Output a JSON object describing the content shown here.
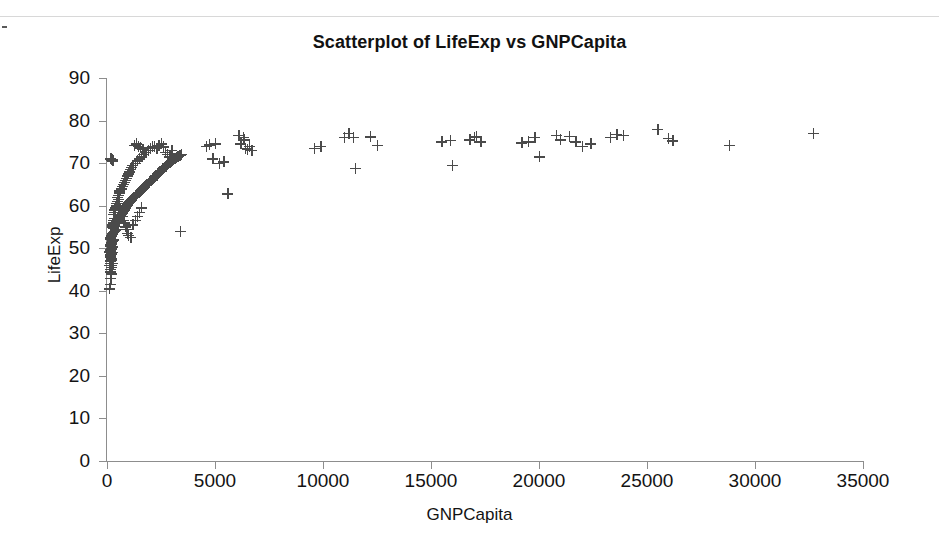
{
  "chart_data": {
    "type": "scatter",
    "title": "Scatterplot of LifeExp vs GNPCapita",
    "xlabel": "GNPCapita",
    "ylabel": "LifeExp",
    "xlim": [
      0,
      35000
    ],
    "ylim": [
      0,
      90
    ],
    "xticks": [
      0,
      5000,
      10000,
      15000,
      20000,
      25000,
      30000,
      35000
    ],
    "yticks": [
      0,
      10,
      20,
      30,
      40,
      50,
      60,
      70,
      80,
      90
    ],
    "grid": false,
    "legend": null,
    "marker": "plus",
    "marker_color": "#4a4a4a",
    "points": [
      [
        120,
        40.5
      ],
      [
        150,
        41.5
      ],
      [
        170,
        43.0
      ],
      [
        190,
        44.0
      ],
      [
        200,
        45.5
      ],
      [
        130,
        46.0
      ],
      [
        160,
        46.5
      ],
      [
        180,
        47.0
      ],
      [
        210,
        47.2
      ],
      [
        230,
        47.5
      ],
      [
        140,
        48.0
      ],
      [
        165,
        48.2
      ],
      [
        185,
        48.5
      ],
      [
        205,
        48.7
      ],
      [
        225,
        48.9
      ],
      [
        250,
        49.0
      ],
      [
        135,
        49.2
      ],
      [
        155,
        49.4
      ],
      [
        175,
        49.6
      ],
      [
        195,
        49.8
      ],
      [
        215,
        50.0
      ],
      [
        240,
        50.2
      ],
      [
        260,
        50.4
      ],
      [
        145,
        50.6
      ],
      [
        168,
        50.8
      ],
      [
        188,
        51.0
      ],
      [
        208,
        51.2
      ],
      [
        228,
        51.4
      ],
      [
        255,
        51.6
      ],
      [
        275,
        51.8
      ],
      [
        300,
        52.0
      ],
      [
        158,
        52.2
      ],
      [
        178,
        52.5
      ],
      [
        198,
        52.8
      ],
      [
        218,
        53.0
      ],
      [
        245,
        53.2
      ],
      [
        270,
        53.5
      ],
      [
        320,
        53.8
      ],
      [
        350,
        54.0
      ],
      [
        380,
        54.2
      ],
      [
        410,
        54.5
      ],
      [
        280,
        54.8
      ],
      [
        310,
        55.0
      ],
      [
        340,
        55.2
      ],
      [
        370,
        55.5
      ],
      [
        400,
        55.8
      ],
      [
        430,
        56.0
      ],
      [
        460,
        56.2
      ],
      [
        490,
        56.5
      ],
      [
        520,
        56.8
      ],
      [
        550,
        57.0
      ],
      [
        580,
        57.2
      ],
      [
        610,
        57.5
      ],
      [
        640,
        57.8
      ],
      [
        670,
        58.0
      ],
      [
        700,
        58.2
      ],
      [
        730,
        58.5
      ],
      [
        760,
        58.8
      ],
      [
        790,
        59.0
      ],
      [
        820,
        59.2
      ],
      [
        850,
        59.5
      ],
      [
        880,
        59.8
      ],
      [
        910,
        60.0
      ],
      [
        940,
        60.2
      ],
      [
        970,
        60.5
      ],
      [
        1000,
        60.8
      ],
      [
        1050,
        61.0
      ],
      [
        1100,
        61.2
      ],
      [
        1150,
        61.5
      ],
      [
        1200,
        61.8
      ],
      [
        1250,
        62.0
      ],
      [
        1300,
        62.2
      ],
      [
        1350,
        62.5
      ],
      [
        1400,
        62.8
      ],
      [
        1450,
        63.0
      ],
      [
        1500,
        63.2
      ],
      [
        1550,
        63.5
      ],
      [
        1600,
        63.8
      ],
      [
        1650,
        64.0
      ],
      [
        1700,
        64.2
      ],
      [
        1750,
        64.5
      ],
      [
        1800,
        64.8
      ],
      [
        1850,
        65.0
      ],
      [
        1900,
        65.2
      ],
      [
        1950,
        65.5
      ],
      [
        2000,
        65.8
      ],
      [
        2050,
        66.0
      ],
      [
        2100,
        66.2
      ],
      [
        2150,
        66.5
      ],
      [
        2200,
        66.8
      ],
      [
        2250,
        67.0
      ],
      [
        2300,
        67.2
      ],
      [
        2350,
        67.5
      ],
      [
        2400,
        67.8
      ],
      [
        2450,
        68.0
      ],
      [
        2500,
        68.2
      ],
      [
        2550,
        68.5
      ],
      [
        2600,
        68.8
      ],
      [
        2650,
        69.0
      ],
      [
        2700,
        69.2
      ],
      [
        2750,
        69.5
      ],
      [
        2800,
        69.8
      ],
      [
        2850,
        70.0
      ],
      [
        2900,
        70.2
      ],
      [
        2950,
        70.4
      ],
      [
        3000,
        70.6
      ],
      [
        3050,
        70.8
      ],
      [
        3100,
        71.0
      ],
      [
        3150,
        71.2
      ],
      [
        3200,
        71.4
      ],
      [
        3250,
        71.5
      ],
      [
        3300,
        71.6
      ],
      [
        3350,
        71.8
      ],
      [
        3400,
        71.9
      ],
      [
        3450,
        72.0
      ],
      [
        200,
        70.8
      ],
      [
        240,
        70.9
      ],
      [
        180,
        71.0
      ],
      [
        260,
        70.5
      ],
      [
        500,
        62.0
      ],
      [
        530,
        62.5
      ],
      [
        560,
        63.0
      ],
      [
        600,
        63.5
      ],
      [
        650,
        64.0
      ],
      [
        700,
        64.5
      ],
      [
        750,
        65.0
      ],
      [
        800,
        65.5
      ],
      [
        850,
        66.0
      ],
      [
        900,
        66.5
      ],
      [
        950,
        67.0
      ],
      [
        1000,
        67.5
      ],
      [
        1050,
        68.0
      ],
      [
        1100,
        68.5
      ],
      [
        1150,
        69.0
      ],
      [
        1200,
        69.5
      ],
      [
        1300,
        70.0
      ],
      [
        1400,
        70.5
      ],
      [
        1500,
        71.0
      ],
      [
        1600,
        71.5
      ],
      [
        1700,
        72.0
      ],
      [
        1800,
        72.5
      ],
      [
        1900,
        73.0
      ],
      [
        2000,
        73.5
      ],
      [
        2100,
        73.8
      ],
      [
        1250,
        74.2
      ],
      [
        1350,
        74.5
      ],
      [
        1450,
        74.0
      ],
      [
        1550,
        73.6
      ],
      [
        1650,
        73.2
      ],
      [
        600,
        59.0
      ],
      [
        650,
        58.5
      ],
      [
        700,
        57.5
      ],
      [
        750,
        56.5
      ],
      [
        800,
        56.0
      ],
      [
        850,
        55.0
      ],
      [
        900,
        54.5
      ],
      [
        950,
        53.5
      ],
      [
        1000,
        53.0
      ],
      [
        1100,
        52.5
      ],
      [
        1200,
        55.5
      ],
      [
        1300,
        56.5
      ],
      [
        1400,
        57.5
      ],
      [
        1500,
        58.5
      ],
      [
        1600,
        59.5
      ],
      [
        300,
        58.0
      ],
      [
        330,
        58.5
      ],
      [
        360,
        59.0
      ],
      [
        390,
        59.5
      ],
      [
        420,
        60.0
      ],
      [
        450,
        60.5
      ],
      [
        480,
        61.0
      ],
      [
        510,
        61.5
      ],
      [
        540,
        60.0
      ],
      [
        570,
        60.5
      ],
      [
        240,
        55.0
      ],
      [
        270,
        55.5
      ],
      [
        290,
        56.0
      ],
      [
        310,
        56.5
      ],
      [
        330,
        57.0
      ],
      [
        150,
        44.5
      ],
      [
        170,
        45.0
      ],
      [
        200,
        45.5
      ],
      [
        230,
        46.0
      ],
      [
        260,
        46.5
      ],
      [
        2200,
        74.0
      ],
      [
        2300,
        73.5
      ],
      [
        2400,
        74.2
      ],
      [
        2500,
        74.5
      ],
      [
        2600,
        73.8
      ],
      [
        2700,
        72.5
      ],
      [
        2800,
        72.0
      ],
      [
        2900,
        71.5
      ],
      [
        3000,
        73.0
      ],
      [
        3400,
        54.0
      ],
      [
        4600,
        74.0
      ],
      [
        4750,
        74.3
      ],
      [
        4900,
        71.0
      ],
      [
        5000,
        74.5
      ],
      [
        5200,
        70.0
      ],
      [
        5400,
        70.3
      ],
      [
        5600,
        62.8
      ],
      [
        6100,
        76.5
      ],
      [
        6200,
        74.5
      ],
      [
        6300,
        76.0
      ],
      [
        6350,
        75.5
      ],
      [
        6400,
        73.5
      ],
      [
        6500,
        73.2
      ],
      [
        6600,
        74.0
      ],
      [
        6700,
        73.0
      ],
      [
        9600,
        73.5
      ],
      [
        9900,
        74.0
      ],
      [
        11000,
        76.0
      ],
      [
        11200,
        77.0
      ],
      [
        11400,
        76.0
      ],
      [
        11500,
        68.8
      ],
      [
        12200,
        76.2
      ],
      [
        12500,
        74.2
      ],
      [
        15500,
        75.0
      ],
      [
        15900,
        75.3
      ],
      [
        16000,
        69.5
      ],
      [
        16800,
        75.5
      ],
      [
        17000,
        76.0
      ],
      [
        17100,
        76.2
      ],
      [
        17300,
        75.0
      ],
      [
        19200,
        74.8
      ],
      [
        19500,
        75.0
      ],
      [
        19800,
        76.0
      ],
      [
        20000,
        71.5
      ],
      [
        20800,
        76.5
      ],
      [
        21000,
        75.5
      ],
      [
        21400,
        76.3
      ],
      [
        21700,
        75.0
      ],
      [
        22000,
        74.0
      ],
      [
        22400,
        74.5
      ],
      [
        23300,
        76.0
      ],
      [
        23600,
        76.8
      ],
      [
        23900,
        76.5
      ],
      [
        25500,
        78.0
      ],
      [
        26000,
        75.8
      ],
      [
        26200,
        75.2
      ],
      [
        28800,
        74.2
      ],
      [
        32700,
        77.0
      ]
    ]
  },
  "axis": {
    "x_tick_labels": [
      "0",
      "5000",
      "10000",
      "15000",
      "20000",
      "25000",
      "30000",
      "35000"
    ],
    "y_tick_labels": [
      "0",
      "10",
      "20",
      "30",
      "40",
      "50",
      "60",
      "70",
      "80",
      "90"
    ]
  }
}
